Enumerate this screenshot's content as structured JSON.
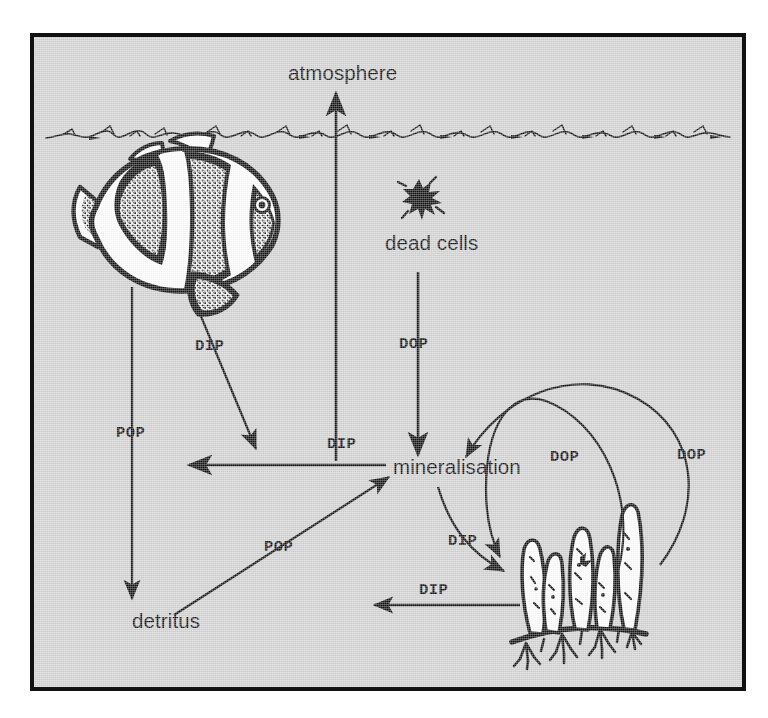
{
  "figure": {
    "frame_border_color": "#111111",
    "background_color": "#d4d4d4",
    "ink_color": "#141414"
  },
  "nodes": [
    {
      "id": "atmosphere",
      "label": "atmosphere",
      "kind": "text-node"
    },
    {
      "id": "dead-cells",
      "label": "dead cells",
      "kind": "text-node"
    },
    {
      "id": "mineralisation",
      "label": "mineralisation",
      "kind": "text-node"
    },
    {
      "id": "detritus",
      "label": "detritus",
      "kind": "text-node"
    }
  ],
  "illustrations": [
    {
      "id": "clownfish",
      "name": "clownfish-illustration",
      "description": "banded anemonefish facing right"
    },
    {
      "id": "dead-cell-blob",
      "name": "dead-cell-blob-icon",
      "description": "small irregular black speck"
    },
    {
      "id": "algae",
      "name": "algae-illustration",
      "description": "finger-like algae on a creeping rhizome with root tufts"
    },
    {
      "id": "water-surface",
      "name": "water-surface-line",
      "description": "hand-drawn wavy sea surface line"
    }
  ],
  "flux_labels": {
    "dip_fish": "DIP",
    "dip_atmosphere": "DIP",
    "dop_dead_cells": "DOP",
    "pop_fish": "POP",
    "pop_detritus": "POP",
    "dip_plant": "DIP",
    "dip_horizontal": "DIP",
    "dop_inner": "DOP",
    "dop_outer": "DOP"
  },
  "arrows": [
    {
      "id": "dip-to-atmosphere",
      "label": "DIP",
      "from": "mineralisation",
      "to": "atmosphere",
      "style": "straight-vertical"
    },
    {
      "id": "dop-dead-cells",
      "label": "DOP",
      "from": "dead cells",
      "to": "mineralisation",
      "style": "straight-vertical"
    },
    {
      "id": "dip-fish",
      "label": "DIP",
      "from": "clownfish",
      "to": "mineralisation",
      "style": "straight-diagonal"
    },
    {
      "id": "pop-fish",
      "label": "POP",
      "from": "clownfish",
      "to": "detritus",
      "style": "straight-vertical"
    },
    {
      "id": "pop-detritus",
      "label": "POP",
      "from": "detritus",
      "to": "mineralisation",
      "style": "straight-diagonal"
    },
    {
      "id": "dip-westward",
      "label": "",
      "from": "mineralisation",
      "to": "water column",
      "style": "straight-horizontal-left"
    },
    {
      "id": "dip-plant",
      "label": "DIP",
      "from": "mineralisation",
      "to": "algae",
      "style": "curved"
    },
    {
      "id": "dip-horizontal",
      "label": "DIP",
      "from": "algae",
      "to": "detritus",
      "style": "straight-horizontal-left"
    },
    {
      "id": "dop-inner",
      "label": "DOP",
      "from": "mineralisation",
      "to": "algae",
      "style": "arc"
    },
    {
      "id": "dop-outer",
      "label": "DOP",
      "from": "algae",
      "to": "mineralisation",
      "style": "arc"
    }
  ],
  "legend_terms": {
    "DIP": "DIP",
    "DOP": "DOP",
    "POP": "POP"
  }
}
